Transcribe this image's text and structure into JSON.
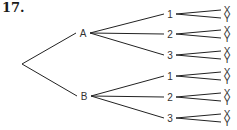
{
  "problem_number": "17.",
  "tree": {
    "root": {
      "x": 22,
      "y": 64
    },
    "level1": [
      {
        "label": "A",
        "x": 83,
        "y": 33,
        "children": [
          {
            "label": "1",
            "x": 170,
            "y": 14
          },
          {
            "label": "2",
            "x": 170,
            "y": 34
          },
          {
            "label": "3",
            "x": 170,
            "y": 55
          }
        ]
      },
      {
        "label": "B",
        "x": 84,
        "y": 96,
        "children": [
          {
            "label": "1",
            "x": 170,
            "y": 76
          },
          {
            "label": "2",
            "x": 170,
            "y": 97
          },
          {
            "label": "3",
            "x": 170,
            "y": 118
          }
        ]
      }
    ],
    "leaf_labels": [
      "X",
      "Y"
    ]
  }
}
